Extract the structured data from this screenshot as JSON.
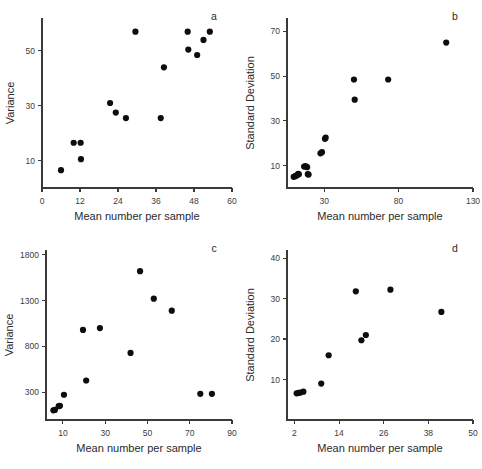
{
  "figure": {
    "background_color": "#ffffff",
    "point_color": "#0d0d0d",
    "axis_color": "#3a3a3a",
    "shared_xlabel": "Mean number per sample"
  },
  "chart_data": [
    {
      "id": "a",
      "panel_letter": "a",
      "type": "scatter",
      "title": "",
      "xlabel": "Mean number per sample",
      "ylabel": "Variance",
      "xlim": [
        0,
        60
      ],
      "ylim": [
        0,
        62
      ],
      "xticks": [
        0,
        12,
        24,
        36,
        48,
        60
      ],
      "xticklabels": [
        "0",
        "12",
        "24",
        "36",
        "48",
        "60"
      ],
      "yticks": [
        10,
        30,
        50
      ],
      "yticklabels": [
        "10",
        "30",
        "50"
      ],
      "grid": false,
      "legend": null,
      "points": [
        {
          "x": 6.0,
          "y": 6.5
        },
        {
          "x": 10.0,
          "y": 16.5
        },
        {
          "x": 12.2,
          "y": 16.5
        },
        {
          "x": 12.3,
          "y": 10.5
        },
        {
          "x": 21.5,
          "y": 31.0
        },
        {
          "x": 23.3,
          "y": 27.5
        },
        {
          "x": 26.5,
          "y": 25.5
        },
        {
          "x": 29.5,
          "y": 57.0
        },
        {
          "x": 37.5,
          "y": 25.5
        },
        {
          "x": 38.5,
          "y": 44.0
        },
        {
          "x": 46.0,
          "y": 57.0
        },
        {
          "x": 46.2,
          "y": 50.5
        },
        {
          "x": 49.0,
          "y": 48.5
        },
        {
          "x": 51.0,
          "y": 54.0
        },
        {
          "x": 53.0,
          "y": 57.0
        }
      ]
    },
    {
      "id": "b",
      "panel_letter": "b",
      "type": "scatter",
      "title": "",
      "xlabel": "Mean number per sample",
      "ylabel": "Standard Deviation",
      "xlim": [
        5,
        130
      ],
      "ylim": [
        0,
        76
      ],
      "xticks": [
        30,
        80,
        130
      ],
      "xticklabels": [
        "30",
        "80",
        "130"
      ],
      "yticks": [
        10,
        30,
        50,
        70
      ],
      "yticklabels": [
        "10",
        "30",
        "50",
        "70"
      ],
      "grid": false,
      "legend": null,
      "points": [
        {
          "x": 9.5,
          "y": 5.0
        },
        {
          "x": 10.5,
          "y": 5.3
        },
        {
          "x": 11.5,
          "y": 5.6
        },
        {
          "x": 12.5,
          "y": 6.3
        },
        {
          "x": 13.0,
          "y": 6.1
        },
        {
          "x": 16.5,
          "y": 9.6
        },
        {
          "x": 17.5,
          "y": 9.8
        },
        {
          "x": 18.5,
          "y": 9.3
        },
        {
          "x": 19.0,
          "y": 6.2
        },
        {
          "x": 19.5,
          "y": 6.0
        },
        {
          "x": 27.5,
          "y": 15.5
        },
        {
          "x": 28.5,
          "y": 16.0
        },
        {
          "x": 30.5,
          "y": 22.0
        },
        {
          "x": 31.0,
          "y": 22.5
        },
        {
          "x": 50.0,
          "y": 48.5
        },
        {
          "x": 50.5,
          "y": 39.5
        },
        {
          "x": 73.0,
          "y": 48.5
        },
        {
          "x": 112.0,
          "y": 65.0
        }
      ]
    },
    {
      "id": "c",
      "panel_letter": "c",
      "type": "scatter",
      "title": "",
      "xlabel": "Mean number per sample",
      "ylabel": "Variance",
      "xlim": [
        2,
        90
      ],
      "ylim": [
        0,
        1850
      ],
      "xticks": [
        10,
        30,
        50,
        70,
        90
      ],
      "xticklabels": [
        "10",
        "30",
        "50",
        "70",
        "90"
      ],
      "yticks": [
        300,
        800,
        1300,
        1800
      ],
      "yticklabels": [
        "300",
        "800",
        "1300",
        "1800"
      ],
      "grid": false,
      "legend": null,
      "points": [
        {
          "x": 5.5,
          "y": 105
        },
        {
          "x": 6.2,
          "y": 110
        },
        {
          "x": 8.0,
          "y": 150
        },
        {
          "x": 8.6,
          "y": 155
        },
        {
          "x": 10.5,
          "y": 275
        },
        {
          "x": 19.5,
          "y": 980
        },
        {
          "x": 21.0,
          "y": 430
        },
        {
          "x": 27.5,
          "y": 1000
        },
        {
          "x": 42.0,
          "y": 730
        },
        {
          "x": 46.5,
          "y": 1620
        },
        {
          "x": 53.0,
          "y": 1320
        },
        {
          "x": 61.5,
          "y": 1190
        },
        {
          "x": 75.0,
          "y": 285
        },
        {
          "x": 80.5,
          "y": 285
        }
      ]
    },
    {
      "id": "d",
      "panel_letter": "d",
      "type": "scatter",
      "title": "",
      "xlabel": "Mean number per sample",
      "ylabel": "Standard Deviation",
      "xlim": [
        0,
        50
      ],
      "ylim": [
        0,
        42
      ],
      "xticks": [
        2,
        14,
        26,
        38,
        50
      ],
      "xticklabels": [
        "2",
        "14",
        "26",
        "38",
        "50"
      ],
      "yticks": [
        10,
        20,
        30,
        40
      ],
      "yticklabels": [
        "10",
        "20",
        "30",
        "40"
      ],
      "grid": false,
      "legend": null,
      "points": [
        {
          "x": 2.6,
          "y": 6.6
        },
        {
          "x": 3.1,
          "y": 6.7
        },
        {
          "x": 3.6,
          "y": 6.8
        },
        {
          "x": 4.4,
          "y": 7.0
        },
        {
          "x": 9.2,
          "y": 9.0
        },
        {
          "x": 11.2,
          "y": 16.0
        },
        {
          "x": 18.5,
          "y": 31.8
        },
        {
          "x": 20.0,
          "y": 19.7
        },
        {
          "x": 21.2,
          "y": 21.0
        },
        {
          "x": 27.8,
          "y": 32.2
        },
        {
          "x": 41.5,
          "y": 26.7
        }
      ]
    }
  ]
}
